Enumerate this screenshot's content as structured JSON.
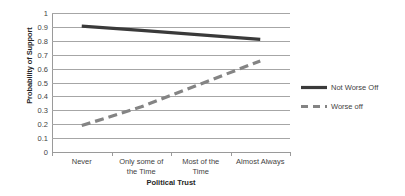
{
  "chart_data": {
    "type": "line",
    "title": "",
    "xlabel": "Political Trust",
    "ylabel": "Probability of Support",
    "categories": [
      "Never",
      "Only some of\nthe Time",
      "Most of the\nTime",
      "Almost Always"
    ],
    "category_labels": [
      {
        "line1": "Never",
        "line2": ""
      },
      {
        "line1": "Only some of",
        "line2": "the Time"
      },
      {
        "line1": "Most of the",
        "line2": "Time"
      },
      {
        "line1": "Almost Always",
        "line2": ""
      }
    ],
    "ylim": [
      0,
      1
    ],
    "ytick_step": 0.1,
    "yticks": [
      "1",
      "0.9",
      "0.8",
      "0.7",
      "0.6",
      "0.5",
      "0.4",
      "0.3",
      "0.2",
      "0.1",
      "0"
    ],
    "ytick_values": [
      1,
      0.9,
      0.8,
      0.7,
      0.6,
      0.5,
      0.4,
      0.3,
      0.2,
      0.1,
      0
    ],
    "grid": true,
    "grid_axis": "y",
    "legend_position": "right",
    "series": [
      {
        "name": "Not Worse Off",
        "values": [
          0.905,
          0.875,
          0.843,
          0.81
        ],
        "style": "solid",
        "color": "#3a3a3a",
        "width": 3.2
      },
      {
        "name": "Worse off",
        "values": [
          0.19,
          0.325,
          0.49,
          0.655
        ],
        "style": "dashed",
        "color": "#848484",
        "width": 3.2
      }
    ]
  },
  "legend": {
    "items": [
      {
        "label": "Not Worse Off"
      },
      {
        "label": "Worse off"
      }
    ]
  },
  "colors": {
    "series_solid": "#3a3a3a",
    "series_dashed": "#848484",
    "gridline": "#a6a6a6",
    "axis": "#9a9a9a",
    "text": "#3f3f3f",
    "title_text": "#262626",
    "background": "#ffffff"
  }
}
